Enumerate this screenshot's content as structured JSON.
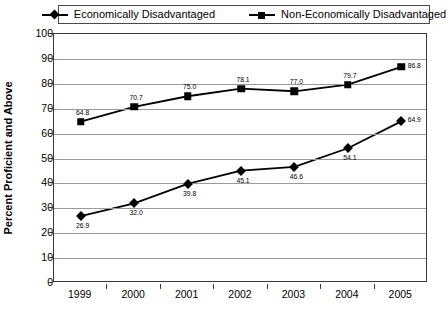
{
  "chart_data": {
    "type": "line",
    "title": "",
    "xlabel": "",
    "ylabel": "Percent Proficient and Above",
    "categories": [
      "1999",
      "2000",
      "2001",
      "2002",
      "2003",
      "2004",
      "2005"
    ],
    "ylim": [
      0,
      100
    ],
    "yticks": [
      "0",
      "10",
      "20",
      "30",
      "40",
      "50",
      "60",
      "70",
      "80",
      "90",
      "100"
    ],
    "grid": true,
    "legend_position": "top",
    "series": [
      {
        "name": "Economically Disadvantaged",
        "marker": "diamond",
        "values": [
          26.9,
          32.0,
          39.8,
          45.1,
          46.6,
          54.1,
          64.9
        ],
        "labels": [
          "26.9",
          "32.0",
          "39.8",
          "45.1",
          "46.6",
          "54.1",
          "64.9"
        ]
      },
      {
        "name": "Non-Economically Disadvantaged",
        "marker": "square",
        "values": [
          64.8,
          70.7,
          75.0,
          78.1,
          77.0,
          79.7,
          86.8
        ],
        "labels": [
          "64.8",
          "70.7",
          "75.0",
          "78.1",
          "77.0",
          "79.7",
          "86.8"
        ]
      }
    ],
    "colors": {
      "series_line": "#000000",
      "gridline": "#9a9a9a",
      "axis": "#3a3a3a",
      "background": "#ffffff"
    }
  },
  "legend": {
    "items": [
      {
        "label": "Economically Disadvantaged",
        "marker": "diamond-marker-icon"
      },
      {
        "label": "Non-Economically Disadvantaged",
        "marker": "square-marker-icon"
      }
    ]
  }
}
